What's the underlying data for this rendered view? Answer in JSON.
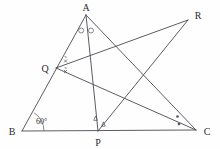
{
  "figure": {
    "type": "euclidean-geometry-diagram",
    "canvas": {
      "width": 220,
      "height": 149
    },
    "stroke_color": "#4a4a52",
    "mark_color": "#55555d",
    "label_color": "#2b2b30",
    "background": "#fefefe"
  },
  "vertices": [
    {
      "id": "A",
      "label": "A",
      "x": 86,
      "y": 15,
      "label_x": 82,
      "label_y": 11,
      "anchor": "middle"
    },
    {
      "id": "B",
      "label": "B",
      "x": 22,
      "y": 131,
      "label_x": 12,
      "label_y": 134,
      "anchor": "middle"
    },
    {
      "id": "C",
      "label": "C",
      "x": 196,
      "y": 130,
      "label_x": 207,
      "label_y": 134,
      "anchor": "middle"
    },
    {
      "id": "P",
      "label": "P",
      "x": 98,
      "y": 131,
      "label_x": 98,
      "label_y": 146,
      "anchor": "middle"
    },
    {
      "id": "Q",
      "label": "Q",
      "x": 56,
      "y": 68,
      "label_x": 45,
      "label_y": 71,
      "anchor": "middle"
    },
    {
      "id": "R",
      "label": "R",
      "x": 188,
      "y": 20,
      "label_x": 198,
      "label_y": 18,
      "anchor": "middle"
    }
  ],
  "segments": [
    {
      "id": "BA",
      "from": "B",
      "to": "A",
      "note": "side AB, passes through Q"
    },
    {
      "id": "BC",
      "from": "B",
      "to": "C",
      "note": "base BC, passes through P"
    },
    {
      "id": "AP",
      "from": "A",
      "to": "P",
      "note": "cevian from A to P"
    },
    {
      "id": "AC",
      "from": "A",
      "to": "C",
      "note": "side AC"
    },
    {
      "id": "QR",
      "from": "Q",
      "to": "R",
      "note": "segment Q to R"
    },
    {
      "id": "QC",
      "from": "Q",
      "to": "C",
      "note": "segment Q to C"
    },
    {
      "id": "PR",
      "from": "P",
      "to": "R",
      "note": "segment P to R"
    }
  ],
  "angle_marks": [
    {
      "id": "angle-B-60",
      "vertex": "B",
      "label": "60°",
      "label_x": 43,
      "label_y": 122,
      "style": "single-arc",
      "note": "angle ABC measures 60 degrees"
    },
    {
      "id": "angle-A-left-circle",
      "vertex": "A",
      "style": "small-circle",
      "label": "",
      "note": "angle BAP marked with open circle"
    },
    {
      "id": "angle-A-right-circle",
      "vertex": "A",
      "style": "small-circle",
      "label": "",
      "note": "angle PAC marked with open circle, equal to BAP"
    },
    {
      "id": "angle-Q-upper-x",
      "vertex": "Q",
      "style": "x-mark",
      "label": "x",
      "note": "angle at Q above QR marked x"
    },
    {
      "id": "angle-Q-lower-x",
      "vertex": "Q",
      "style": "x-mark",
      "label": "x",
      "note": "angle at Q below QR marked x, equal angles"
    },
    {
      "id": "angle-P-upper-triangle",
      "vertex": "P",
      "style": "triangle-mark",
      "label": "",
      "note": "angle at P marked with small triangle"
    },
    {
      "id": "angle-P-lower-triangle",
      "vertex": "P",
      "style": "triangle-mark",
      "label": "",
      "note": "angle at P marked with small triangle, equal"
    },
    {
      "id": "angle-C-upper-dot",
      "vertex": "C",
      "style": "dot-mark",
      "label": "",
      "note": "angle at C marked with filled dot"
    },
    {
      "id": "angle-C-lower-dot",
      "vertex": "C",
      "style": "dot-mark",
      "label": "",
      "note": "angle at C marked with filled dot, equal"
    }
  ]
}
